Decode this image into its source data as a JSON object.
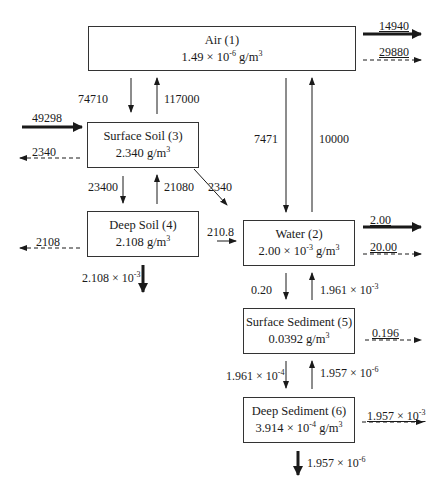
{
  "diagram": {
    "type": "compartment-flow-diagram",
    "compartments": [
      {
        "id": 1,
        "name": "Air (1)",
        "conc_mant": "1.49 × 10",
        "conc_exp": "-6",
        "conc_unit": " g/m",
        "unit_exp": "3"
      },
      {
        "id": 2,
        "name": "Water (2)",
        "conc_mant": "2.00 × 10",
        "conc_exp": "-3",
        "conc_unit": " g/m",
        "unit_exp": "3"
      },
      {
        "id": 3,
        "name": "Surface Soil (3)",
        "conc_mant": "2.340",
        "conc_exp": "",
        "conc_unit": " g/m",
        "unit_exp": "3"
      },
      {
        "id": 4,
        "name": "Deep Soil (4)",
        "conc_mant": "2.108",
        "conc_exp": "",
        "conc_unit": " g/m",
        "unit_exp": "3"
      },
      {
        "id": 5,
        "name": "Surface Sediment (5)",
        "conc_mant": "0.0392",
        "conc_exp": "",
        "conc_unit": " g/m",
        "unit_exp": "3"
      },
      {
        "id": 6,
        "name": "Deep Sediment (6)",
        "conc_mant": "3.914 × 10",
        "conc_exp": "-4",
        "conc_unit": " g/m",
        "unit_exp": "3"
      }
    ],
    "flows": {
      "air_out_advection": "14940",
      "air_out_reaction": "29880",
      "air_to_surface_soil": "74710",
      "surface_soil_to_air": "117000",
      "input_surface_soil": "49298",
      "surface_soil_reaction": "2340",
      "surface_soil_to_deep_soil": "23400",
      "deep_soil_to_surface_soil": "21080",
      "surface_soil_to_water": "2340",
      "air_to_water": "7471",
      "water_to_air": "10000",
      "deep_soil_reaction": "2108",
      "deep_soil_to_water": "210.8",
      "deep_soil_burial_mant": "2.108 × 10",
      "deep_soil_burial_exp": "-3",
      "water_out_advection": "2.00",
      "water_out_reaction": "20.00",
      "water_to_surface_sediment": "0.20",
      "surface_sediment_to_water_mant": "1.961 × 10",
      "surface_sediment_to_water_exp": "-3",
      "surface_sediment_reaction": "0.196",
      "surface_sediment_to_deep_sediment_mant": "1.961 × 10",
      "surface_sediment_to_deep_sediment_exp": "-4",
      "deep_sediment_to_surface_sediment_mant": "1.957 × 10",
      "deep_sediment_to_surface_sediment_exp": "-6",
      "deep_sediment_reaction_mant": "1.957 × 10",
      "deep_sediment_reaction_exp": "-3",
      "deep_sediment_burial_mant": "1.957 × 10",
      "deep_sediment_burial_exp": "-6"
    },
    "legend": {
      "solid_bold_arrow": "advection / burial",
      "dashed_arrow": "reaction loss",
      "thin_arrow": "intercompartmental transfer"
    }
  }
}
